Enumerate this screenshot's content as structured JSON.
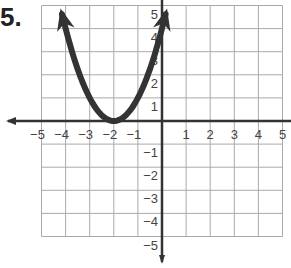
{
  "problem": {
    "number_label": "5."
  },
  "chart_data": {
    "type": "line",
    "title": "",
    "xlabel": "",
    "ylabel": "",
    "xlim": [
      -5,
      5
    ],
    "ylim": [
      -5,
      5
    ],
    "grid": true,
    "x_ticks": [
      "-5",
      "-4",
      "-3",
      "-2",
      "-1",
      "1",
      "2",
      "3",
      "4",
      "5"
    ],
    "y_ticks": [
      "5",
      "4",
      "3",
      "2",
      "1",
      "-1",
      "-2",
      "-3",
      "-4",
      "-5"
    ],
    "series": [
      {
        "name": "parabola",
        "equation": "y = (x + 2)^2",
        "vertex": [
          -2,
          0
        ],
        "x": [
          -4.2,
          -4,
          -3,
          -2,
          -1,
          0,
          0.2
        ],
        "y": [
          4.84,
          4,
          1,
          0,
          1,
          4,
          4.84
        ],
        "arrows": "both ends"
      }
    ],
    "colors": {
      "curve": "#333333",
      "grid": "#aaaaaa",
      "axes": "#333333"
    }
  }
}
